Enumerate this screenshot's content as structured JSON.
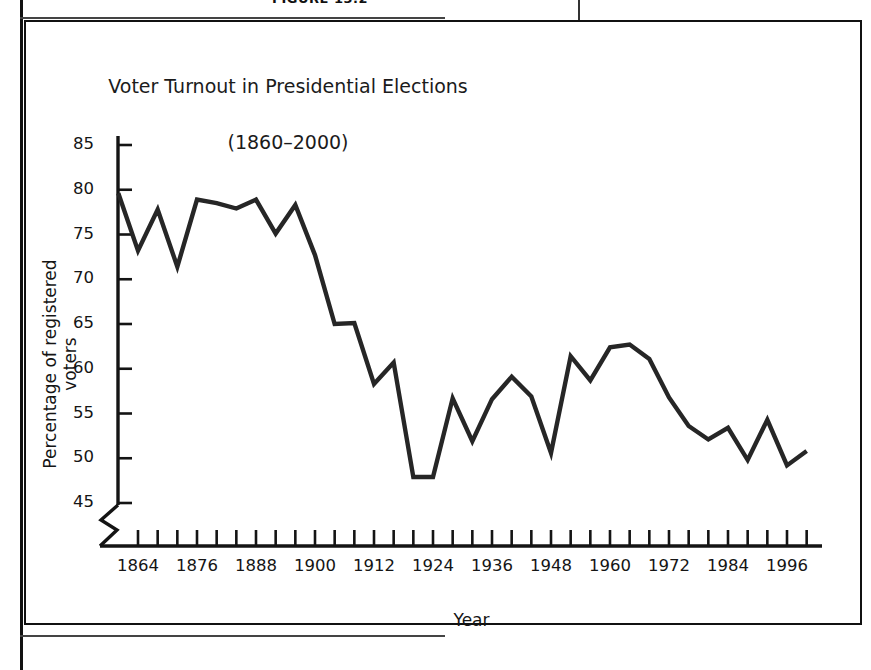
{
  "page": {
    "figure_header": "FIGURE 13.2"
  },
  "chart_data": {
    "type": "line",
    "title": "Voter Turnout in Presidential Elections\n(1860–2000)",
    "title_line1": "Voter Turnout in Presidential Elections",
    "title_line2": "(1860–2000)",
    "xlabel": "Year",
    "ylabel": "Percentage of registered voters",
    "ylim": [
      45,
      85
    ],
    "xlim": [
      1860,
      2000
    ],
    "y_ticks": [
      45,
      50,
      55,
      60,
      65,
      70,
      75,
      80,
      85
    ],
    "y_tick_labels": [
      "45",
      "50",
      "55",
      "60",
      "65",
      "70",
      "75",
      "80",
      "85"
    ],
    "y_axis_broken": true,
    "x_tick_labels": [
      "1864",
      "1876",
      "1888",
      "1900",
      "1912",
      "1924",
      "1936",
      "1948",
      "1960",
      "1972",
      "1984",
      "1996"
    ],
    "x_tick_interval_years": 4,
    "x_label_interval_years": 12,
    "grid": false,
    "legend": false,
    "line_color": "#262626",
    "x": [
      1860,
      1864,
      1868,
      1872,
      1876,
      1880,
      1884,
      1888,
      1892,
      1896,
      1900,
      1904,
      1908,
      1912,
      1916,
      1920,
      1924,
      1928,
      1932,
      1936,
      1940,
      1944,
      1948,
      1952,
      1956,
      1960,
      1964,
      1968,
      1972,
      1976,
      1980,
      1984,
      1988,
      1992,
      1996,
      2000
    ],
    "values": [
      79.6,
      73.2,
      77.8,
      71.4,
      78.9,
      78.5,
      77.9,
      78.9,
      75.1,
      78.3,
      72.7,
      65.0,
      65.1,
      58.3,
      60.7,
      47.9,
      47.9,
      56.7,
      51.9,
      56.6,
      59.1,
      56.9,
      50.6,
      61.4,
      58.7,
      62.4,
      62.7,
      61.1,
      56.8,
      53.6,
      52.1,
      53.4,
      49.8,
      54.3,
      49.2,
      50.8
    ]
  }
}
